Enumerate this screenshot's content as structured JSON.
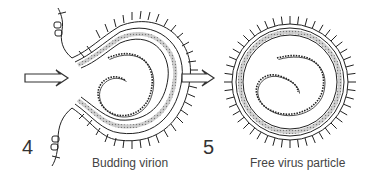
{
  "panels": [
    {
      "number": "4",
      "caption": "Budding virion"
    },
    {
      "number": "5",
      "caption": "Free virus particle"
    }
  ],
  "colors": {
    "stroke": "#222222",
    "membrane_fill": "#bbbbbb",
    "background": "#ffffff"
  }
}
